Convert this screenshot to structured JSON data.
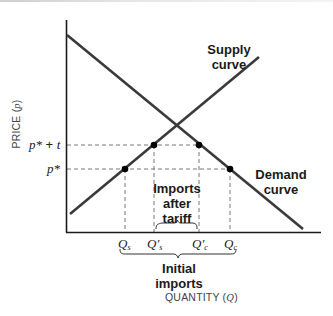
{
  "diagram": {
    "axes": {
      "y_title": "PRICE",
      "y_symbol": "p",
      "x_title": "QUANTITY",
      "x_symbol": "Q"
    },
    "curves": {
      "supply": {
        "label_line1": "Supply",
        "label_line2": "curve"
      },
      "demand": {
        "label_line1": "Demand",
        "label_line2": "curve"
      }
    },
    "price_levels": {
      "tariff_price": {
        "base": "p*",
        "op": " + ",
        "var": "t"
      },
      "world_price": {
        "base": "p*"
      }
    },
    "quantity_ticks": [
      {
        "sym": "Q",
        "prime": "",
        "sub": "s"
      },
      {
        "sym": "Q",
        "prime": "′",
        "sub": "s"
      },
      {
        "sym": "Q",
        "prime": "′",
        "sub": "c"
      },
      {
        "sym": "Q",
        "prime": "",
        "sub": "c"
      }
    ],
    "annotations": {
      "imports_after_tariff": {
        "line1": "Imports",
        "line2": "after",
        "line3": "tariff"
      },
      "initial_imports": {
        "line1": "Initial",
        "line2": "imports"
      }
    },
    "colors": {
      "line": "#333333",
      "dash": "#666666",
      "point": "#000000",
      "text": "#1a1a1a"
    }
  }
}
